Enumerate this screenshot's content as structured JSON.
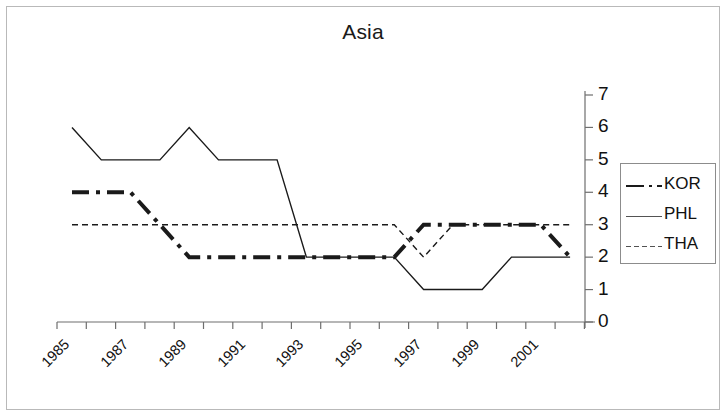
{
  "chart_data": {
    "type": "line",
    "title": "Asia",
    "xlabel": "",
    "ylabel": "",
    "x": [
      1985,
      1986,
      1987,
      1988,
      1989,
      1990,
      1991,
      1992,
      1993,
      1994,
      1995,
      1996,
      1997,
      1998,
      1999,
      2000,
      2001,
      2002
    ],
    "xtick_labels": [
      "1985",
      "1987",
      "1989",
      "1991",
      "1993",
      "1995",
      "1997",
      "1999",
      "2001"
    ],
    "xtick_values": [
      1985,
      1987,
      1989,
      1991,
      1993,
      1995,
      1997,
      1999,
      2001
    ],
    "ytick_labels": [
      "0",
      "1",
      "2",
      "3",
      "4",
      "5",
      "6",
      "7"
    ],
    "ytick_values": [
      0,
      1,
      2,
      3,
      4,
      5,
      6,
      7
    ],
    "ylim": [
      0,
      7
    ],
    "xlim": [
      1985,
      2002
    ],
    "grid": false,
    "legend_position": "right",
    "yaxis_side": "right",
    "series": [
      {
        "name": "KOR",
        "style": "dash-dot",
        "width": 4,
        "color": "#1a1a1a",
        "values": [
          4,
          4,
          4,
          3,
          2,
          2,
          2,
          2,
          2,
          2,
          2,
          2,
          3,
          3,
          3,
          3,
          3,
          2
        ]
      },
      {
        "name": "PHL",
        "style": "solid",
        "width": 1.4,
        "color": "#1a1a1a",
        "values": [
          6,
          5,
          5,
          5,
          6,
          5,
          5,
          5,
          2,
          2,
          2,
          2,
          1,
          1,
          1,
          2,
          2,
          2
        ]
      },
      {
        "name": "THA",
        "style": "dashed",
        "width": 1.4,
        "color": "#1a1a1a",
        "values": [
          3,
          3,
          3,
          3,
          3,
          3,
          3,
          3,
          3,
          3,
          3,
          3,
          2,
          3,
          3,
          3,
          3,
          3
        ]
      }
    ]
  },
  "legend": {
    "entries": [
      {
        "label": "KOR"
      },
      {
        "label": "PHL"
      },
      {
        "label": "THA"
      }
    ]
  }
}
